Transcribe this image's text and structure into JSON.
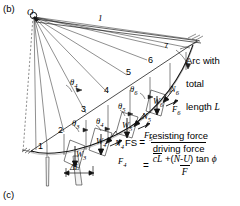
{
  "figure": {
    "panel_top_tag": "(b)",
    "panel_bottom_tag": "(c)",
    "center_point_label": "O",
    "radius_label": "1",
    "arc_note": "Arc with\ntotal\nlength L",
    "arc_note_line1": "Arc with",
    "arc_note_line2": "total",
    "arc_note_line3": "length L",
    "delta_l_label": "ΔL"
  },
  "slices": [
    {
      "number": "1"
    },
    {
      "number": "2"
    },
    {
      "number": "3"
    },
    {
      "number": "4"
    },
    {
      "number": "5"
    },
    {
      "number": "6"
    },
    {
      "number": "7"
    }
  ],
  "angles": [
    {
      "label": "θ",
      "sub": "3"
    },
    {
      "label": "θ",
      "sub": "4"
    },
    {
      "label": "θ",
      "sub": "4"
    },
    {
      "label": "θ",
      "sub": "5"
    },
    {
      "label": "θ",
      "sub": "6"
    }
  ],
  "force_vectors": [
    {
      "label": "W",
      "sub": "3"
    },
    {
      "label": "W",
      "sub": "4"
    },
    {
      "label": "N",
      "sub": "4"
    },
    {
      "label": "F",
      "sub": "4"
    },
    {
      "label": "W",
      "sub": "5"
    },
    {
      "label": "N",
      "sub": "5"
    },
    {
      "label": "F",
      "sub": "5"
    },
    {
      "label": "W",
      "sub": "6"
    },
    {
      "label": "N",
      "sub": "6"
    },
    {
      "label": "F",
      "sub": "6"
    }
  ],
  "equation": {
    "lhs": "FS",
    "equals": "=",
    "numerator_1": "resisting force",
    "denominator_1": "driving force",
    "equals_2": "=",
    "numerator_2_c": "c",
    "numerator_2_L": "L",
    "numerator_2_mid": " +(",
    "numerator_2_N": "N",
    "numerator_2_minus": "-",
    "numerator_2_U": "U",
    "numerator_2_tail": ") tan ",
    "numerator_2_phi": "ϕ",
    "denominator_2": "F"
  },
  "colors": {
    "ink": "#000000",
    "line": "#1a1a1a",
    "background": "#ffffff",
    "thin_line": "#4a4a4a"
  }
}
